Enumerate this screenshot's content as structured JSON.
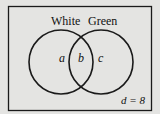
{
  "diagram": {
    "type": "venn",
    "sets": [
      {
        "name": "White",
        "region_label": "a"
      },
      {
        "name": "Green",
        "region_label": "c"
      }
    ],
    "intersection_label": "b",
    "outside_label": "d = 8",
    "colors": {
      "background": "#e4e4e2",
      "stroke": "#1a1a1a"
    }
  }
}
